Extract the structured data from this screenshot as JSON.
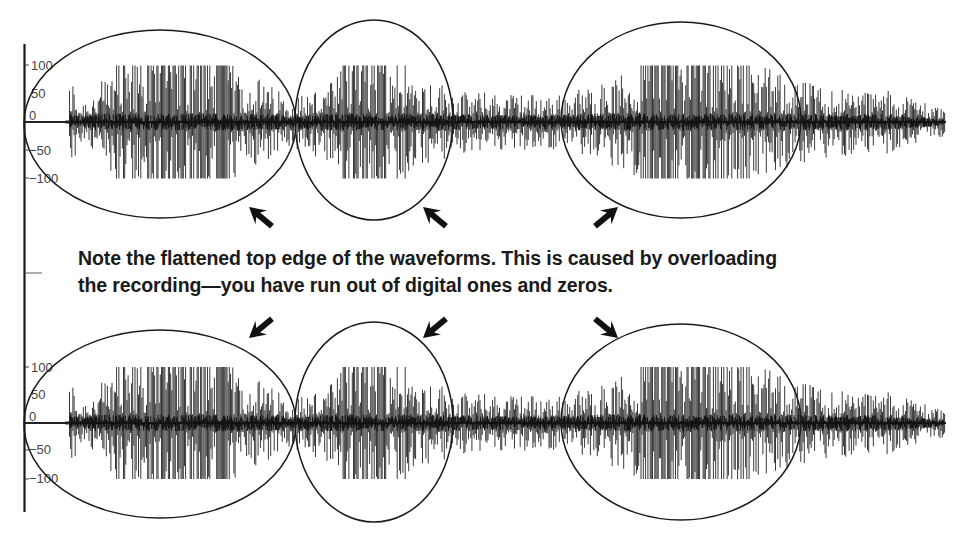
{
  "chart_data": {
    "type": "line",
    "title": "",
    "xlabel": "",
    "ylabel": "",
    "ylim": [
      -100,
      100
    ],
    "yticks": [
      100,
      50,
      0,
      -50,
      -100
    ],
    "ytick_labels": [
      "100",
      "50",
      "0",
      "−50",
      "−100"
    ],
    "grid": false,
    "legend": null,
    "series": [
      {
        "name": "channel-top",
        "clip_level": 100,
        "clipped_regions_px": [
          [
            115,
            235
          ],
          [
            340,
            410
          ],
          [
            640,
            760
          ]
        ],
        "envelope": [
          {
            "x": 66,
            "amp": 4
          },
          {
            "x": 70,
            "amp": 95
          },
          {
            "x": 80,
            "amp": 40
          },
          {
            "x": 120,
            "amp": 100
          },
          {
            "x": 240,
            "amp": 100
          },
          {
            "x": 290,
            "amp": 45
          },
          {
            "x": 330,
            "amp": 70
          },
          {
            "x": 345,
            "amp": 100
          },
          {
            "x": 410,
            "amp": 100
          },
          {
            "x": 460,
            "amp": 55
          },
          {
            "x": 560,
            "amp": 50
          },
          {
            "x": 600,
            "amp": 70
          },
          {
            "x": 640,
            "amp": 100
          },
          {
            "x": 760,
            "amp": 100
          },
          {
            "x": 820,
            "amp": 65
          },
          {
            "x": 900,
            "amp": 55
          },
          {
            "x": 945,
            "amp": 25
          }
        ]
      },
      {
        "name": "channel-bottom",
        "clip_level": 100,
        "clipped_regions_px": [
          [
            115,
            235
          ],
          [
            340,
            410
          ],
          [
            640,
            760
          ]
        ],
        "envelope": [
          {
            "x": 66,
            "amp": 4
          },
          {
            "x": 70,
            "amp": 95
          },
          {
            "x": 80,
            "amp": 40
          },
          {
            "x": 120,
            "amp": 100
          },
          {
            "x": 240,
            "amp": 100
          },
          {
            "x": 290,
            "amp": 45
          },
          {
            "x": 330,
            "amp": 70
          },
          {
            "x": 345,
            "amp": 100
          },
          {
            "x": 410,
            "amp": 100
          },
          {
            "x": 460,
            "amp": 55
          },
          {
            "x": 560,
            "amp": 50
          },
          {
            "x": 600,
            "amp": 70
          },
          {
            "x": 640,
            "amp": 100
          },
          {
            "x": 760,
            "amp": 100
          },
          {
            "x": 820,
            "amp": 65
          },
          {
            "x": 900,
            "amp": 55
          },
          {
            "x": 945,
            "amp": 25
          }
        ]
      }
    ],
    "annotations": [
      "Note the flattened top edge of the waveforms. This is caused by overloading",
      "the recording—you have run out of digital ones and zeros."
    ]
  },
  "caption": {
    "line1": "Note the flattened top edge of the waveforms. This is caused by overloading",
    "line2": "the recording—you have run out of digital ones and zeros."
  },
  "axis": {
    "labels": [
      "100",
      "50",
      "0",
      "−50",
      "−100"
    ]
  },
  "colors": {
    "ink": "#1a1a1a",
    "wave": "#222222",
    "label": "#444444",
    "background": "#ffffff"
  }
}
